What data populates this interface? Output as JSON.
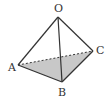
{
  "diagram": {
    "type": "tetrahedron",
    "vertices": {
      "O": {
        "label": "O",
        "x": 58,
        "y": 17
      },
      "A": {
        "label": "A",
        "x": 18,
        "y": 65
      },
      "B": {
        "label": "B",
        "x": 62,
        "y": 82
      },
      "C": {
        "label": "C",
        "x": 93,
        "y": 51
      }
    },
    "edges": [
      {
        "from": "O",
        "to": "A",
        "style": "solid"
      },
      {
        "from": "O",
        "to": "B",
        "style": "solid"
      },
      {
        "from": "O",
        "to": "C",
        "style": "solid"
      },
      {
        "from": "A",
        "to": "B",
        "style": "solid"
      },
      {
        "from": "B",
        "to": "C",
        "style": "solid"
      },
      {
        "from": "A",
        "to": "C",
        "style": "dashed"
      }
    ],
    "shaded_face": [
      "A",
      "B",
      "C"
    ],
    "colors": {
      "line": "#333333",
      "shade": "#c8c8c8"
    }
  }
}
